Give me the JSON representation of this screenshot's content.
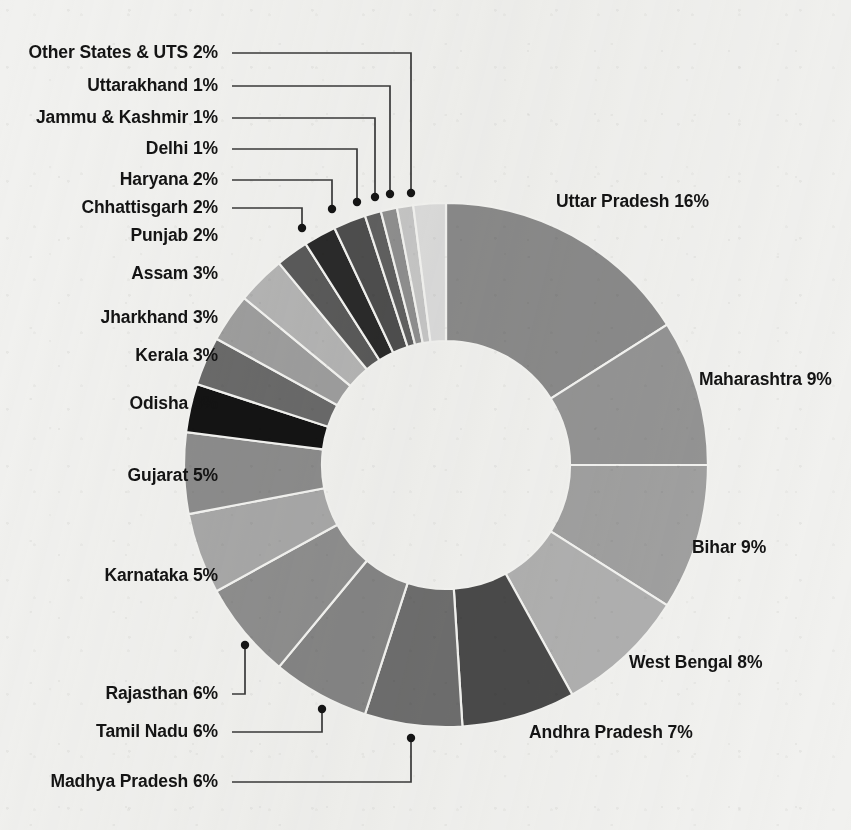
{
  "chart_data": {
    "type": "pie",
    "variant": "donut",
    "title": "",
    "subtitle": "",
    "xlabel": "",
    "ylabel": "",
    "legend_position": "none",
    "grid": false,
    "units": "percent",
    "total": 100,
    "label_format": "{name} {value}%",
    "start_angle_deg": 0,
    "direction": "clockwise",
    "inner_radius_ratio": 0.47,
    "categories": [
      "Uttar Pradesh",
      "Maharashtra",
      "Bihar",
      "West Bengal",
      "Andhra Pradesh",
      "Madhya Pradesh",
      "Tamil Nadu",
      "Rajasthan",
      "Karnataka",
      "Gujarat",
      "Odisha",
      "Kerala",
      "Jharkhand",
      "Assam",
      "Punjab",
      "Chhattisgarh",
      "Haryana",
      "Delhi",
      "Jammu & Kashmir",
      "Uttarakhand",
      "Other States & UTS"
    ],
    "values": [
      16,
      9,
      9,
      8,
      7,
      6,
      6,
      6,
      5,
      5,
      3,
      3,
      3,
      3,
      2,
      2,
      2,
      1,
      1,
      1,
      2
    ],
    "colors": [
      "#8a8a8a",
      "#949494",
      "#a0a0a0",
      "#b0b0b0",
      "#4a4a4a",
      "#6e6e6e",
      "#858585",
      "#8e8e8e",
      "#a8a8a8",
      "#8c8c8c",
      "#141414",
      "#6a6a6a",
      "#9e9e9e",
      "#b4b4b4",
      "#5a5a5a",
      "#2a2a2a",
      "#4e4e4e",
      "#606060",
      "#8f8f8f",
      "#c6c6c6",
      "#dcdcdc"
    ],
    "slices": [
      {
        "name": "Uttar Pradesh",
        "value": 16,
        "label": "Uttar Pradesh 16%",
        "color": "#8a8a8a",
        "label_x": 556,
        "label_y": 207,
        "anchor": "start",
        "leader": false
      },
      {
        "name": "Maharashtra",
        "value": 9,
        "label": "Maharashtra 9%",
        "color": "#949494",
        "label_x": 699,
        "label_y": 385,
        "anchor": "start",
        "leader": false
      },
      {
        "name": "Bihar",
        "value": 9,
        "label": "Bihar 9%",
        "color": "#a0a0a0",
        "label_x": 692,
        "label_y": 553,
        "anchor": "start",
        "leader": false
      },
      {
        "name": "West Bengal",
        "value": 8,
        "label": "West Bengal 8%",
        "color": "#b0b0b0",
        "label_x": 629,
        "label_y": 668,
        "anchor": "start",
        "leader": false
      },
      {
        "name": "Andhra Pradesh",
        "value": 7,
        "label": "Andhra Pradesh 7%",
        "color": "#4a4a4a",
        "label_x": 529,
        "label_y": 738,
        "anchor": "start",
        "leader": false
      },
      {
        "name": "Madhya Pradesh",
        "value": 6,
        "label": "Madhya Pradesh 6%",
        "color": "#6e6e6e",
        "label_x": 218,
        "label_y": 787,
        "anchor": "end",
        "leader": true,
        "lx1": 232,
        "ly1": 782,
        "lx2": 411,
        "ly2": 782,
        "lx3": 411,
        "ly3": 738
      },
      {
        "name": "Tamil Nadu",
        "value": 6,
        "label": "Tamil Nadu 6%",
        "color": "#858585",
        "label_x": 218,
        "label_y": 737,
        "anchor": "end",
        "leader": true,
        "lx1": 232,
        "ly1": 732,
        "lx2": 322,
        "ly2": 732,
        "lx3": 322,
        "ly3": 709
      },
      {
        "name": "Rajasthan",
        "value": 6,
        "label": "Rajasthan 6%",
        "color": "#8e8e8e",
        "label_x": 218,
        "label_y": 699,
        "anchor": "end",
        "leader": true,
        "lx1": 232,
        "ly1": 694,
        "lx2": 245,
        "ly2": 694,
        "lx3": 245,
        "ly3": 645
      },
      {
        "name": "Karnataka",
        "value": 5,
        "label": "Karnataka 5%",
        "color": "#a8a8a8",
        "label_x": 218,
        "label_y": 581,
        "anchor": "end",
        "leader": false
      },
      {
        "name": "Gujarat",
        "value": 5,
        "label": "Gujarat 5%",
        "color": "#8c8c8c",
        "label_x": 218,
        "label_y": 481,
        "anchor": "end",
        "leader": false
      },
      {
        "name": "Odisha",
        "value": 3,
        "label": "Odisha 3%",
        "color": "#141414",
        "label_x": 218,
        "label_y": 409,
        "anchor": "end",
        "leader": false
      },
      {
        "name": "Kerala",
        "value": 3,
        "label": "Kerala 3%",
        "color": "#6a6a6a",
        "label_x": 218,
        "label_y": 361,
        "anchor": "end",
        "leader": false
      },
      {
        "name": "Jharkhand",
        "value": 3,
        "label": "Jharkhand 3%",
        "color": "#9e9e9e",
        "label_x": 218,
        "label_y": 323,
        "anchor": "end",
        "leader": false
      },
      {
        "name": "Assam",
        "value": 3,
        "label": "Assam 3%",
        "color": "#b4b4b4",
        "label_x": 218,
        "label_y": 279,
        "anchor": "end",
        "leader": false
      },
      {
        "name": "Punjab",
        "value": 2,
        "label": "Punjab 2%",
        "color": "#5a5a5a",
        "label_x": 218,
        "label_y": 241,
        "anchor": "end",
        "leader": false
      },
      {
        "name": "Chhattisgarh",
        "value": 2,
        "label": "Chhattisgarh 2%",
        "color": "#2a2a2a",
        "label_x": 218,
        "label_y": 213,
        "anchor": "end",
        "leader": true,
        "lx1": 232,
        "ly1": 208,
        "lx2": 302,
        "ly2": 208,
        "lx3": 302,
        "ly3": 228
      },
      {
        "name": "Haryana",
        "value": 2,
        "label": "Haryana 2%",
        "color": "#4e4e4e",
        "label_x": 218,
        "label_y": 185,
        "anchor": "end",
        "leader": true,
        "lx1": 232,
        "ly1": 180,
        "lx2": 332,
        "ly2": 180,
        "lx3": 332,
        "ly3": 209
      },
      {
        "name": "Delhi",
        "value": 1,
        "label": "Delhi 1%",
        "color": "#606060",
        "label_x": 218,
        "label_y": 154,
        "anchor": "end",
        "leader": true,
        "lx1": 232,
        "ly1": 149,
        "lx2": 357,
        "ly2": 149,
        "lx3": 357,
        "ly3": 202
      },
      {
        "name": "Jammu & Kashmir",
        "value": 1,
        "label": "Jammu & Kashmir 1%",
        "color": "#8f8f8f",
        "label_x": 218,
        "label_y": 123,
        "anchor": "end",
        "leader": true,
        "lx1": 232,
        "ly1": 118,
        "lx2": 375,
        "ly2": 118,
        "lx3": 375,
        "ly3": 197
      },
      {
        "name": "Uttarakhand",
        "value": 1,
        "label": "Uttarakhand 1%",
        "color": "#c6c6c6",
        "label_x": 218,
        "label_y": 91,
        "anchor": "end",
        "leader": true,
        "lx1": 232,
        "ly1": 86,
        "lx2": 390,
        "ly2": 86,
        "lx3": 390,
        "ly3": 194
      },
      {
        "name": "Other States & UTS",
        "value": 2,
        "label": "Other States & UTS  2%",
        "color": "#dcdcdc",
        "label_x": 218,
        "label_y": 58,
        "anchor": "end",
        "leader": true,
        "lx1": 232,
        "ly1": 53,
        "lx2": 411,
        "ly2": 53,
        "lx3": 411,
        "ly3": 193
      }
    ],
    "geometry": {
      "cx": 446,
      "cy": 465,
      "outer_r": 262,
      "inner_r": 124
    }
  }
}
